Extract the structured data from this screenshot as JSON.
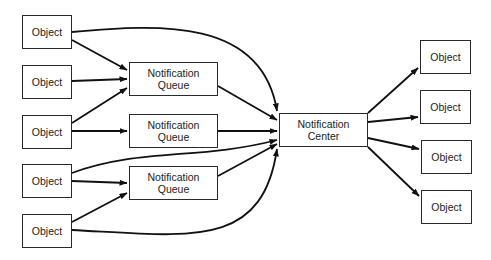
{
  "diagram": {
    "title": "",
    "colors": {
      "stroke": "#111111",
      "box_border": "#2a2a2a",
      "text": "#222222",
      "background": "#ffffff"
    },
    "nodes": [
      {
        "id": "src1",
        "label": "Object",
        "x": 22,
        "y": 15,
        "w": 50,
        "h": 34
      },
      {
        "id": "src2",
        "label": "Object",
        "x": 22,
        "y": 65,
        "w": 50,
        "h": 34
      },
      {
        "id": "src3",
        "label": "Object",
        "x": 22,
        "y": 115,
        "w": 50,
        "h": 34
      },
      {
        "id": "src4",
        "label": "Object",
        "x": 22,
        "y": 164,
        "w": 50,
        "h": 34
      },
      {
        "id": "src5",
        "label": "Object",
        "x": 22,
        "y": 214,
        "w": 50,
        "h": 34
      },
      {
        "id": "q1",
        "label": "Notification\nQueue",
        "x": 129,
        "y": 62,
        "w": 89,
        "h": 34
      },
      {
        "id": "q2",
        "label": "Notification\nQueue",
        "x": 129,
        "y": 114,
        "w": 89,
        "h": 34
      },
      {
        "id": "q3",
        "label": "Notification\nQueue",
        "x": 129,
        "y": 166,
        "w": 89,
        "h": 34
      },
      {
        "id": "center",
        "label": "Notification\nCenter",
        "x": 279,
        "y": 113,
        "w": 89,
        "h": 34
      },
      {
        "id": "dst1",
        "label": "Object",
        "x": 420,
        "y": 40,
        "w": 51,
        "h": 34
      },
      {
        "id": "dst2",
        "label": "Object",
        "x": 420,
        "y": 90,
        "w": 51,
        "h": 34
      },
      {
        "id": "dst3",
        "label": "Object",
        "x": 421,
        "y": 140,
        "w": 51,
        "h": 34
      },
      {
        "id": "dst4",
        "label": "Object",
        "x": 421,
        "y": 190,
        "w": 51,
        "h": 34
      }
    ],
    "edges": [
      {
        "from": "src1",
        "to": "center",
        "d": "M72,32 C160,24 262,18 277,111"
      },
      {
        "from": "src1",
        "to": "q1",
        "d": "M72,40 L127,70"
      },
      {
        "from": "src2",
        "to": "q1",
        "d": "M72,81 L127,79"
      },
      {
        "from": "src3",
        "to": "q1",
        "d": "M72,123 L127,88"
      },
      {
        "from": "src3",
        "to": "q2",
        "d": "M72,131 L127,131"
      },
      {
        "from": "src4",
        "to": "center",
        "d": "M72,173 C140,148 200,160 277,140"
      },
      {
        "from": "src4",
        "to": "q3",
        "d": "M72,181 L127,183"
      },
      {
        "from": "src5",
        "to": "q3",
        "d": "M72,222 L127,193"
      },
      {
        "from": "src5",
        "to": "center",
        "d": "M72,230 C190,236 262,250 277,149"
      },
      {
        "from": "q1",
        "to": "center",
        "d": "M218,86 L277,120"
      },
      {
        "from": "q2",
        "to": "center",
        "d": "M218,131 L277,131"
      },
      {
        "from": "q3",
        "to": "center",
        "d": "M218,176 L277,144"
      },
      {
        "from": "center",
        "to": "dst1",
        "d": "M368,113 L418,68"
      },
      {
        "from": "center",
        "to": "dst2",
        "d": "M368,122 L418,117"
      },
      {
        "from": "center",
        "to": "dst3",
        "d": "M368,138 L419,149"
      },
      {
        "from": "center",
        "to": "dst4",
        "d": "M368,147 L419,196"
      }
    ]
  }
}
